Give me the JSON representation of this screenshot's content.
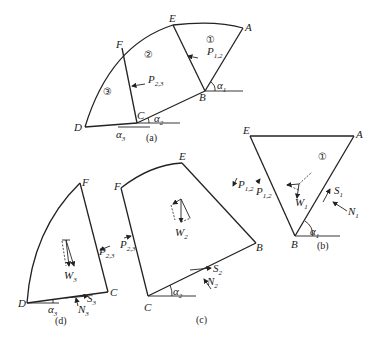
{
  "figure": {
    "panels": [
      {
        "id": "a",
        "caption": "(a)"
      },
      {
        "id": "b",
        "caption": "(b)"
      },
      {
        "id": "c",
        "caption": "(c)"
      },
      {
        "id": "d",
        "caption": "(d)"
      }
    ],
    "slices": [
      "①",
      "②",
      "③"
    ],
    "points": {
      "A": "A",
      "B": "B",
      "C": "C",
      "D": "D",
      "E": "E",
      "F": "F"
    },
    "labels": {
      "P": "P",
      "P12_sub": "1,2",
      "P23_sub": "2,3",
      "W": "W",
      "S": "S",
      "N": "N",
      "alpha": "α",
      "sub1": "1",
      "sub2": "2",
      "sub3": "3"
    }
  }
}
